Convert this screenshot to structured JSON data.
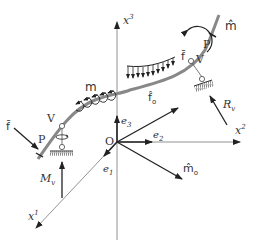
{
  "diagram": {
    "type": "rod-mechanics-free-body",
    "axes": {
      "x1": {
        "base": "x",
        "sup": "1"
      },
      "x2": {
        "base": "x",
        "sup": "2"
      },
      "x3": {
        "base": "x",
        "sup": "3"
      },
      "origin": "O"
    },
    "basis": {
      "e1": {
        "base": "e",
        "sub": "1"
      },
      "e2": {
        "base": "e",
        "sub": "2"
      },
      "e3": {
        "base": "e",
        "sub": "3"
      }
    },
    "loads": {
      "distributed_force": "f̄",
      "distributed_moment": "m",
      "end_force_left": "f̄",
      "end_moment_right": "m̂",
      "origin_force": {
        "base": "f̂",
        "sub": "o"
      },
      "origin_moment": {
        "base": "m̂",
        "sub": "o"
      },
      "reaction_right": {
        "base": "R",
        "sub": "v"
      },
      "reaction_left": {
        "base": "M",
        "sub": "v"
      }
    },
    "points": {
      "left_P": "P",
      "left_V": "V",
      "right_P": "P",
      "right_V": "V"
    }
  }
}
